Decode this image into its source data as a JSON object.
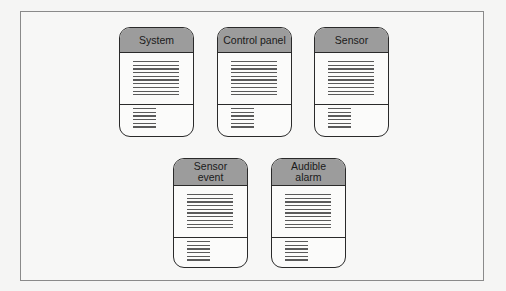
{
  "diagram": {
    "type": "class-diagram",
    "classes": [
      {
        "name": "System",
        "attribute_lines": 10,
        "operation_lines": 6
      },
      {
        "name": "Control panel",
        "attribute_lines": 10,
        "operation_lines": 6
      },
      {
        "name": "Sensor",
        "attribute_lines": 10,
        "operation_lines": 6
      },
      {
        "name": "Sensor event",
        "attribute_lines": 10,
        "operation_lines": 6
      },
      {
        "name": "Audible alarm",
        "attribute_lines": 10,
        "operation_lines": 6
      }
    ]
  },
  "colors": {
    "header_fill": "#9c9c9c",
    "outline": "#2a2a2a",
    "frame_border": "#8a8a8a",
    "background": "#f5f5f4"
  }
}
